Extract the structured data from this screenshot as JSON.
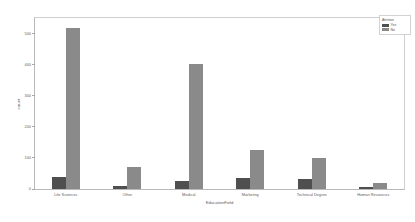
{
  "chart_data": {
    "type": "bar",
    "title": "",
    "xlabel": "EducationField",
    "ylabel": "count",
    "categories": [
      "Life Sciences",
      "Other",
      "Medical",
      "Marketing",
      "Technical Degree",
      "Human Resources"
    ],
    "series": [
      {
        "name": "Yes",
        "color": "#4f4f4f",
        "values": [
          38,
          11,
          27,
          35,
          32,
          7
        ]
      },
      {
        "name": "No",
        "color": "#8a8a8a",
        "values": [
          517,
          71,
          401,
          124,
          100,
          20
        ]
      }
    ],
    "ylim": [
      0,
      550
    ],
    "yticks": [
      0,
      100,
      200,
      300,
      400,
      500
    ],
    "ytick_labels": [
      "0",
      "100",
      "200",
      "300",
      "400",
      "500"
    ],
    "grid": false,
    "legend": {
      "title": "Attrition",
      "position": "top-right",
      "entries": [
        {
          "label": "Yes",
          "color": "#4f4f4f"
        },
        {
          "label": "No",
          "color": "#8a8a8a"
        }
      ]
    }
  }
}
